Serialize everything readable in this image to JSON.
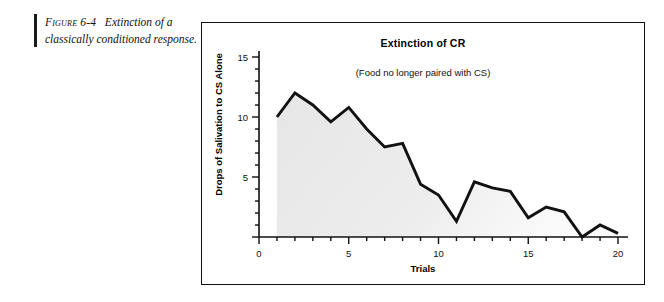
{
  "caption": {
    "figure_label": "Figure 6-4",
    "text": "Extinction of a classically conditioned response."
  },
  "figure": {
    "title": "Extinction of CR",
    "subtitle": "(Food no longer paired with CS)"
  },
  "colors": {
    "line": "#111111",
    "area_fill": "#e6e6e6",
    "axis": "#111111",
    "frame": "#111111",
    "background": "#ffffff"
  },
  "chart_data": {
    "type": "area",
    "title": "Extinction of CR",
    "subtitle": "(Food no longer paired with CS)",
    "xlabel": "Trials",
    "ylabel": "Drops of Salivation to CS Alone",
    "xlim": [
      0,
      20
    ],
    "ylim": [
      0,
      15
    ],
    "xticks": [
      0,
      5,
      10,
      15,
      20
    ],
    "xtick_labels": [
      "0",
      "5",
      "10",
      "15",
      "20"
    ],
    "x_minor_tick_step": 1,
    "yticks": [
      0,
      5,
      10,
      15
    ],
    "ytick_labels": [
      "0",
      "5",
      "10",
      "15"
    ],
    "y_minor_tick_step": 1,
    "grid": false,
    "legend": false,
    "x": [
      1,
      2,
      3,
      4,
      5,
      6,
      7,
      8,
      9,
      10,
      11,
      12,
      13,
      14,
      15,
      16,
      17,
      18,
      19,
      20
    ],
    "values": [
      10,
      12,
      11,
      9.6,
      10.8,
      9,
      7.5,
      7.8,
      4.4,
      3.5,
      1.3,
      4.6,
      4.1,
      3.8,
      1.6,
      2.5,
      2.1,
      0,
      1.0,
      0.3
    ],
    "series": [
      {
        "name": "Drops of Salivation to CS Alone",
        "values": [
          10,
          12,
          11,
          9.6,
          10.8,
          9,
          7.5,
          7.8,
          4.4,
          3.5,
          1.3,
          4.6,
          4.1,
          3.8,
          1.6,
          2.5,
          2.1,
          0,
          1.0,
          0.3
        ]
      }
    ]
  }
}
